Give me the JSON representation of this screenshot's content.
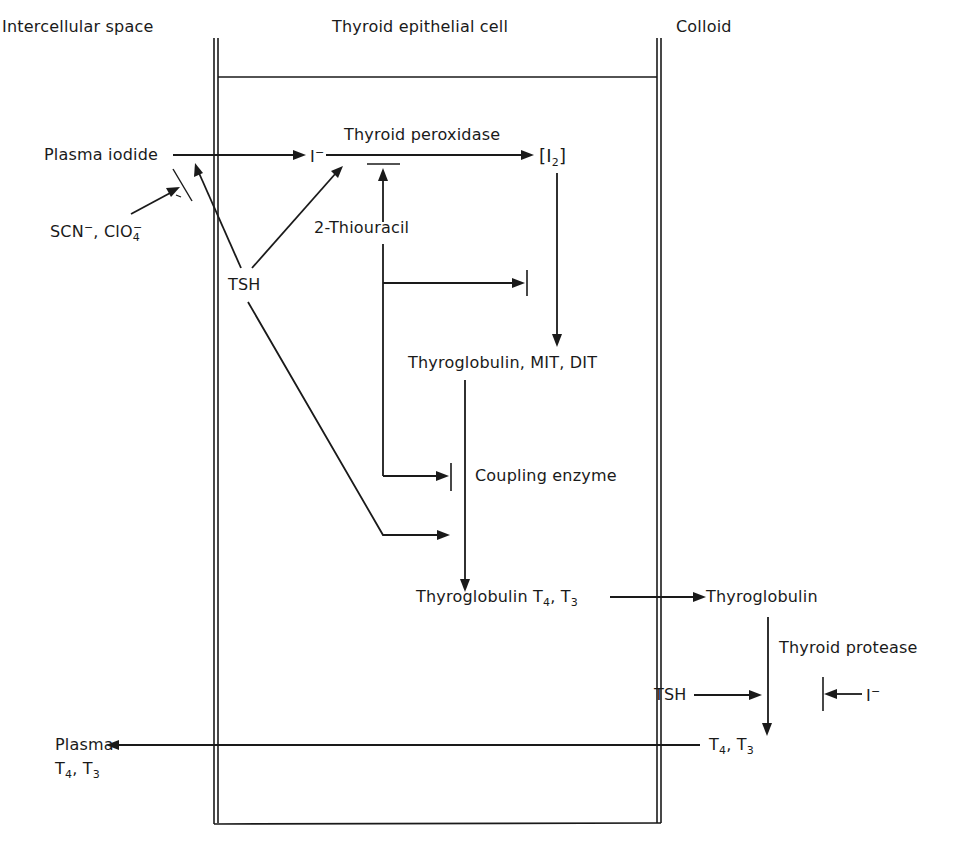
{
  "diagram": {
    "type": "biochemical pathway",
    "compartments": {
      "left": "Intercellular space",
      "middle": "Thyroid epithelial cell",
      "right": "Colloid"
    },
    "nodes": {
      "plasma_iodide": "Plasma iodide",
      "iodide_ion": "I",
      "iodide_charge": "−",
      "peroxidase": "Thyroid peroxidase",
      "iodine_open": "[I",
      "iodine_sub": "2",
      "iodine_close": "]",
      "inhibitor_anions_a": "SCN",
      "inhibitor_anions_a_charge": "−",
      "inhibitor_anions_sep": ", ClO",
      "inhibitor_anions_b_sub": "4",
      "inhibitor_anions_b_charge": "−",
      "tsh_cell": "TSH",
      "thiouracil": "2-Thiouracil",
      "tg_mit_dit": "Thyroglobulin, MIT, DIT",
      "coupling": "Coupling enzyme",
      "tg_t4t3_prefix": "Thyroglobulin T",
      "tg_t4t3_sub4": "4",
      "tg_t4t3_mid": ", T",
      "tg_t4t3_sub3": "3",
      "tg_colloid": "Thyroglobulin",
      "protease": "Thyroid protease",
      "tsh_colloid": "TSH",
      "iodide_colloid": "I",
      "iodide_colloid_charge": "−",
      "t4t3_prefix": "T",
      "t4t3_sub4": "4",
      "t4t3_mid": ", T",
      "t4t3_sub3": "3",
      "plasma_out_line1": "Plasma",
      "plasma_out_prefix": "T",
      "plasma_out_sub4": "4",
      "plasma_out_mid": ", T",
      "plasma_out_sub3": "3"
    },
    "edges": [
      {
        "from": "Plasma iodide",
        "to": "I−",
        "kind": "activation"
      },
      {
        "from": "I−",
        "to": "[I2]",
        "kind": "activation",
        "label": "Thyroid peroxidase"
      },
      {
        "from": "SCN−, ClO4−",
        "to": "Plasma iodide → I− transport",
        "kind": "inhibition"
      },
      {
        "from": "TSH",
        "to": "Plasma iodide transport",
        "kind": "activation"
      },
      {
        "from": "TSH",
        "to": "I− oxidation",
        "kind": "activation"
      },
      {
        "from": "TSH",
        "to": "Coupling",
        "kind": "activation"
      },
      {
        "from": "2-Thiouracil",
        "to": "Thyroid peroxidase",
        "kind": "inhibition"
      },
      {
        "from": "2-Thiouracil",
        "to": "Iodination",
        "kind": "inhibition"
      },
      {
        "from": "2-Thiouracil",
        "to": "Coupling enzyme",
        "kind": "inhibition"
      },
      {
        "from": "[I2]",
        "to": "Thyroglobulin, MIT, DIT",
        "kind": "activation"
      },
      {
        "from": "Thyroglobulin, MIT, DIT",
        "to": "Thyroglobulin T4, T3",
        "kind": "activation",
        "label": "Coupling enzyme"
      },
      {
        "from": "Thyroglobulin T4, T3",
        "to": "Thyroglobulin (colloid)",
        "kind": "activation"
      },
      {
        "from": "Thyroglobulin (colloid)",
        "to": "T4, T3",
        "kind": "activation",
        "label": "Thyroid protease"
      },
      {
        "from": "TSH (colloid)",
        "to": "Thyroid protease",
        "kind": "activation"
      },
      {
        "from": "I− (colloid)",
        "to": "Thyroid protease",
        "kind": "inhibition"
      },
      {
        "from": "T4, T3",
        "to": "Plasma T4, T3",
        "kind": "activation"
      }
    ],
    "colors": {
      "ink": "#1a1a1a",
      "background": "#ffffff"
    }
  }
}
